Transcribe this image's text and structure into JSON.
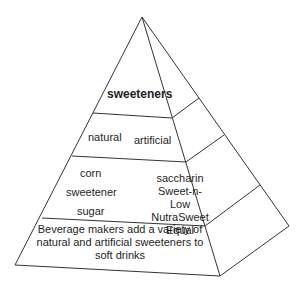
{
  "diagram": {
    "type": "pyramid",
    "levels": [
      {
        "level": 1,
        "label": "sweeteners"
      },
      {
        "level": 2,
        "labels": [
          "natural",
          "artificial"
        ]
      },
      {
        "level": 3,
        "natural": [
          "corn",
          "sweetener",
          "sugar"
        ],
        "artificial": [
          "saccharin",
          "Sweet-n-Low",
          "NutraSweet",
          "Equal"
        ]
      },
      {
        "level": 4,
        "text": "Beverage makers add a variety of natural and artificial sweeteners to soft drinks"
      }
    ]
  },
  "top": {
    "label": "sweeteners"
  },
  "second": {
    "natural": "natural",
    "artificial": "artificial"
  },
  "third": {
    "natural_1": "corn",
    "natural_2": "sweetener",
    "natural_3": "sugar",
    "artificial_1": "saccharin",
    "artificial_2": "Sweet-n-Low",
    "artificial_3": "NutraSweet",
    "artificial_4": "Equal"
  },
  "base": {
    "line1": "Beverage makers add a variety of",
    "line2": "natural and artificial sweeteners to",
    "line3": "soft drinks"
  }
}
